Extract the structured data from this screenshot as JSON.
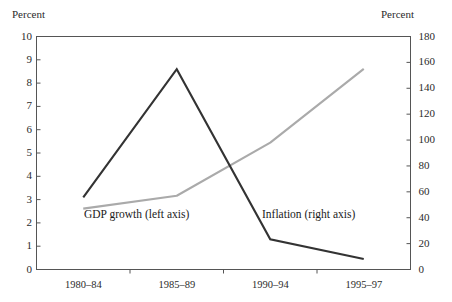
{
  "chart_data": {
    "type": "line",
    "title": "",
    "categories": [
      "1980–84",
      "1985–89",
      "1990–94",
      "1995–97"
    ],
    "xlabel": "",
    "left_axis": {
      "label": "Percent",
      "ylim": [
        0,
        10
      ],
      "ticks": [
        "0",
        "1",
        "2",
        "3",
        "4",
        "5",
        "6",
        "7",
        "8",
        "9",
        "10"
      ],
      "tick_values": [
        0,
        1,
        2,
        3,
        4,
        5,
        6,
        7,
        8,
        9,
        10
      ]
    },
    "right_axis": {
      "label": "Percent",
      "ylim": [
        0,
        180
      ],
      "ticks": [
        "0",
        "20",
        "40",
        "60",
        "80",
        "100",
        "120",
        "140",
        "160",
        "180"
      ],
      "tick_values": [
        0,
        20,
        40,
        60,
        80,
        100,
        120,
        140,
        160,
        180
      ]
    },
    "grid": false,
    "legend_position": "inline-annotation",
    "series": [
      {
        "name": "GDP growth (left axis)",
        "axis": "left",
        "color": "#333333",
        "values": [
          3.1,
          8.6,
          1.3,
          0.45
        ],
        "annotation": "GDP growth (left axis)"
      },
      {
        "name": "Inflation (right axis)",
        "axis": "right",
        "color": "#aaaaaa",
        "values": [
          47,
          57,
          98,
          155
        ],
        "annotation": "Inflation (right axis)"
      }
    ],
    "annotations": [
      "GDP growth (left axis)",
      "Inflation (right axis)"
    ]
  },
  "colors": {
    "dark_series": "#333333",
    "light_series": "#aaaaaa",
    "axis": "#555555",
    "text": "#2b2b2b",
    "background": "#ffffff"
  }
}
